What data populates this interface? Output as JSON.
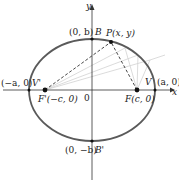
{
  "diagram": {
    "type": "ellipse-foci",
    "colors": {
      "ellipse": "#5a5a5a",
      "axes": "#333333",
      "dashed": "#333333",
      "faint_lines": "#cfcfcf",
      "points": "#111111",
      "background": "#ffffff"
    },
    "axes": {
      "x_label": "x",
      "y_label": "y",
      "origin_label": "0"
    },
    "points": {
      "B": {
        "name": "B",
        "coord": "(0, b)"
      },
      "B_prime": {
        "name": "B'",
        "coord": "(0, −b)"
      },
      "V": {
        "name": "V",
        "coord": "(a, 0)"
      },
      "V_prime": {
        "name": "V'",
        "coord": "(−a, 0)"
      },
      "F": {
        "label": "F(c, 0)"
      },
      "F_prime": {
        "label": "F'(−c, 0)"
      },
      "P": {
        "label": "P(x, y)"
      }
    }
  }
}
